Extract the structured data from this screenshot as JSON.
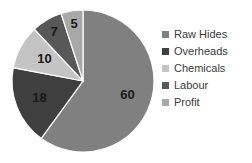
{
  "chart_data": {
    "type": "pie",
    "title": "",
    "categories": [
      "Raw Hides",
      "Overheads",
      "Chemicals",
      "Labour",
      "Profit"
    ],
    "values": [
      60,
      18,
      10,
      7,
      5
    ],
    "labels": [
      "60",
      "18",
      "10",
      "7",
      "5"
    ],
    "colors": [
      "#808080",
      "#3f3f3f",
      "#c4c4c4",
      "#585858",
      "#a8a8a8"
    ],
    "total": 100,
    "start_angle_deg": 0,
    "direction": "clockwise",
    "legend_position": "right",
    "grid": false,
    "show_data_labels": true
  },
  "legend": {
    "items": [
      {
        "label": "Raw Hides",
        "color": "#808080"
      },
      {
        "label": "Overheads",
        "color": "#3f3f3f"
      },
      {
        "label": "Chemicals",
        "color": "#c4c4c4"
      },
      {
        "label": "Labour",
        "color": "#585858"
      },
      {
        "label": "Profit",
        "color": "#a8a8a8"
      }
    ]
  }
}
